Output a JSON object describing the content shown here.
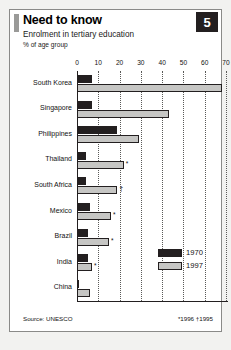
{
  "header": {
    "title": "Need to know",
    "subtitle": "Enrolment in tertiary education",
    "unit": "% of age group",
    "badge": "5"
  },
  "footer": {
    "source": "Source: UNESCO",
    "footnotes": "*1996  †1995"
  },
  "legend": {
    "position": "inside-right",
    "entries": [
      {
        "label": "1970",
        "color": "#231f20"
      },
      {
        "label": "1997",
        "color": "#c6c6c4"
      }
    ]
  },
  "chart_data": {
    "type": "bar",
    "orientation": "horizontal",
    "title": "Need to know",
    "subtitle": "Enrolment in tertiary education",
    "xlabel": "% of age group",
    "ylabel": "",
    "xlim": [
      0,
      70
    ],
    "xticks": [
      0,
      10,
      20,
      30,
      40,
      50,
      60,
      70
    ],
    "grid": true,
    "source": "Source: UNESCO",
    "categories": [
      "South Korea",
      "Singapore",
      "Philippines",
      "Thailand",
      "South Africa",
      "Mexico",
      "Brazil",
      "India",
      "China"
    ],
    "series": [
      {
        "name": "1970",
        "color": "#231f20",
        "values": [
          7,
          7,
          19,
          4,
          4,
          6,
          5,
          5,
          0.2
        ]
      },
      {
        "name": "1997",
        "color": "#c6c6c4",
        "values": [
          68,
          43,
          29,
          22,
          19,
          16,
          15,
          7,
          6
        ]
      }
    ],
    "annotations": [
      {
        "category": "Thailand",
        "series": "1997",
        "marker": "*"
      },
      {
        "category": "South Africa",
        "series": "1997",
        "marker": "†"
      },
      {
        "category": "Mexico",
        "series": "1997",
        "marker": "*"
      },
      {
        "category": "Brazil",
        "series": "1997",
        "marker": "*"
      },
      {
        "category": "India",
        "series": "1997",
        "marker": "*"
      }
    ],
    "footnotes": "*1996  †1995"
  }
}
